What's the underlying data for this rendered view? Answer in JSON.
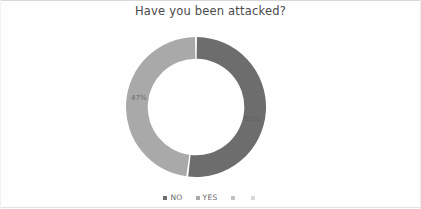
{
  "chart_data": {
    "type": "pie",
    "variant": "doughnut",
    "title": "Have you been attacked?",
    "categories": [
      "NO",
      "YES",
      "",
      ""
    ],
    "values": [
      52,
      48,
      0,
      0
    ],
    "data_labels": [
      "52%",
      "47%",
      "",
      ""
    ],
    "colors": [
      "#6d6d6d",
      "#a9a9a9",
      "#c2c2c2",
      "#d8d8d8"
    ],
    "legend": {
      "position": "bottom",
      "entries": [
        {
          "label": "NO",
          "color": "#6d6d6d"
        },
        {
          "label": "YES",
          "color": "#a9a9a9"
        },
        {
          "label": "",
          "color": "#c2c2c2"
        },
        {
          "label": "",
          "color": "#d8d8d8"
        }
      ]
    },
    "xlabel": "",
    "ylabel": "",
    "grid": false,
    "start_angle_deg": 0,
    "hole_ratio": 0.69
  },
  "slice_labels": {
    "yes_percent": "47%",
    "no_percent": "52%"
  }
}
